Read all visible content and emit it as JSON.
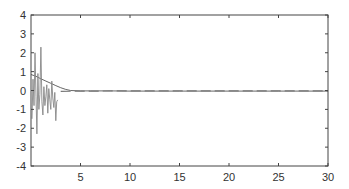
{
  "chart_data": {
    "type": "line",
    "title": "",
    "xlabel": "",
    "ylabel": "",
    "xlim": [
      0,
      30
    ],
    "ylim": [
      -4,
      4
    ],
    "grid": false,
    "legend": null,
    "xticks": [
      5,
      10,
      15,
      20,
      25,
      30
    ],
    "yticks": [
      4,
      3,
      2,
      1,
      0,
      -1,
      -2,
      -3,
      -4
    ],
    "series": [
      {
        "name": "smooth decay",
        "style": "solid",
        "color": "#555555",
        "x": [
          0,
          0.5,
          1,
          1.5,
          2,
          2.5,
          3,
          3.5,
          4,
          5,
          6,
          8,
          10,
          15,
          20,
          25,
          30
        ],
        "y": [
          0.85,
          0.75,
          0.62,
          0.5,
          0.38,
          0.26,
          0.15,
          0.06,
          0.0,
          -0.02,
          -0.02,
          -0.02,
          -0.03,
          -0.03,
          -0.03,
          -0.03,
          -0.03
        ]
      },
      {
        "name": "dashed steady",
        "style": "dashed",
        "color": "#777777",
        "x": [
          3,
          5,
          10,
          15,
          20,
          25,
          30
        ],
        "y": [
          -0.05,
          -0.03,
          -0.02,
          -0.02,
          -0.02,
          -0.02,
          -0.02
        ]
      },
      {
        "name": "noisy transient",
        "style": "solid",
        "color": "#888888",
        "x": [
          0.1,
          0.2,
          0.3,
          0.4,
          0.5,
          0.6,
          0.7,
          0.8,
          0.9,
          1.0,
          1.1,
          1.2,
          1.3,
          1.4,
          1.5,
          1.6,
          1.7,
          1.8,
          1.9,
          2.0,
          2.1,
          2.2,
          2.3,
          2.4,
          2.5,
          2.6,
          2.7
        ],
        "y": [
          -1.5,
          0.6,
          -0.8,
          2.0,
          -0.3,
          -2.3,
          0.9,
          -1.0,
          -0.2,
          2.3,
          -0.6,
          -1.3,
          0.2,
          -0.8,
          -0.3,
          0.3,
          -1.2,
          0.1,
          -0.5,
          -1.0,
          0.5,
          -0.4,
          -0.9,
          -0.1,
          -1.6,
          -0.6,
          -0.5
        ]
      }
    ]
  }
}
